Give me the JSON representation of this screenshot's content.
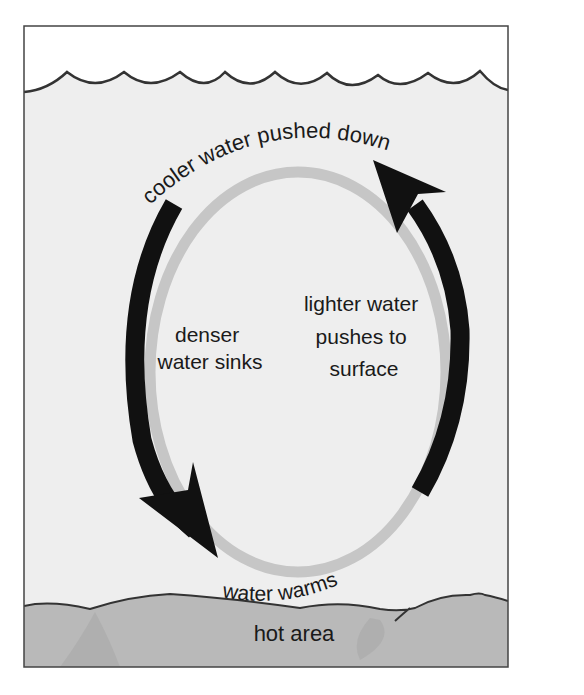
{
  "diagram": {
    "type": "convection-cycle",
    "labels": {
      "top": "cooler water pushed down",
      "left_line1": "denser",
      "left_line2": "water sinks",
      "right_line1": "lighter water",
      "right_line2": "pushes to",
      "right_line3": "surface",
      "bottom": "water warms",
      "ground": "hot area"
    },
    "colors": {
      "sky": "#ffffff",
      "water": "#eeeeee",
      "loop_gray": "#c6c6c6",
      "arrow": "#111111",
      "ground": "#b9b9b9",
      "outline": "#333333"
    },
    "arrows": [
      {
        "name": "sinking-arrow",
        "direction": "down",
        "side": "left"
      },
      {
        "name": "rising-arrow",
        "direction": "up",
        "side": "right"
      }
    ]
  }
}
